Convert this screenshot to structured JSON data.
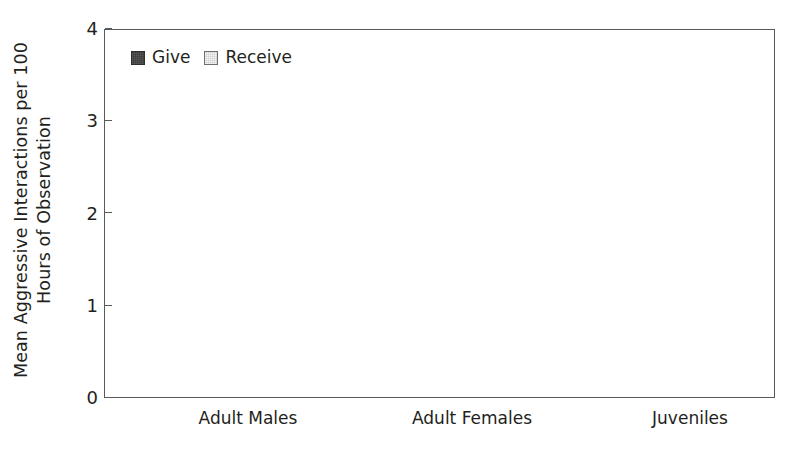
{
  "chart_data": {
    "type": "bar",
    "title": "",
    "subtitle": "",
    "xlabel": "",
    "ylabel": "Mean Aggressive Interactions per 100 Hours of Observation",
    "ylabel_lines": [
      "Mean Aggressive Interactions per 100",
      "Hours of Observation"
    ],
    "categories": [
      "Adult Males",
      "Adult Females",
      "Juveniles"
    ],
    "ylim": [
      0,
      4
    ],
    "yticks": [
      0,
      1,
      2,
      3,
      4
    ],
    "ytick_labels": [
      "0",
      "1",
      "2",
      "3",
      "4"
    ],
    "grid": false,
    "legend_position": "top-left-inside",
    "series": [
      {
        "name": "Give",
        "color": "#3b3b3b",
        "values": [
          0.36,
          0.06,
          2.05
        ],
        "err_low": [
          0.13,
          0.01,
          1.1
        ],
        "err_high": [
          0.62,
          0.12,
          2.95
        ]
      },
      {
        "name": "Receive",
        "color": "#cdcdcd",
        "values": [
          0.24,
          2.15,
          1.33
        ],
        "err_low": [
          0.08,
          1.25,
          1.0
        ],
        "err_high": [
          0.43,
          3.03,
          1.67
        ]
      }
    ]
  },
  "legend": {
    "items": [
      {
        "label": "Give",
        "swatch_class": "give"
      },
      {
        "label": "Receive",
        "swatch_class": "receive"
      }
    ]
  },
  "axes": {
    "y_title_line1": "Mean Aggressive Interactions per 100",
    "y_title_line2": "Hours of Observation",
    "y_tick_0": "0",
    "y_tick_1": "1",
    "y_tick_2": "2",
    "y_tick_3": "3",
    "y_tick_4": "4"
  },
  "xaxis": {
    "cat_0": "Adult Males",
    "cat_1": "Adult Females",
    "cat_2": "Juveniles"
  },
  "colors": {
    "give": "#3b3b3b",
    "receive": "#cdcdcd",
    "frame": "#58595b",
    "error": "#3d3d3d",
    "text": "#231f20",
    "background": "#ffffff"
  }
}
